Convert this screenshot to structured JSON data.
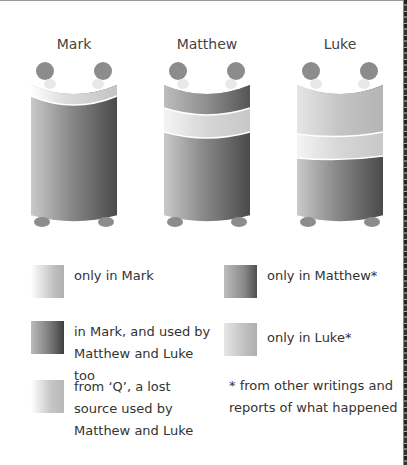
{
  "diagram": {
    "scrolls": [
      {
        "label": "Mark",
        "bands": [
          "only in Mark",
          "in Mark, and used by Matthew and Luke too"
        ]
      },
      {
        "label": "Matthew",
        "bands": [
          "only in Matthew",
          "from Q",
          "in Mark, and used by Matthew and Luke too"
        ]
      },
      {
        "label": "Luke",
        "bands": [
          "only in Luke",
          "from Q",
          "in Mark, and used by Matthew and Luke too"
        ]
      }
    ],
    "colors": {
      "only_mark": "#c8c8c8",
      "shared_mark": "#6a6a6a",
      "from_q": "#d2d2d2",
      "only_matthew": "#7a7a7a",
      "only_luke": "#bdbdbd",
      "roller_knob": "#8c8c8c"
    }
  },
  "legend": {
    "items": [
      {
        "key": "only_mark",
        "text": "only in Mark"
      },
      {
        "key": "only_matthew",
        "text": "only in Matthew*"
      },
      {
        "key": "shared_mark",
        "text": "in Mark, and used by Matthew and Luke too"
      },
      {
        "key": "only_luke",
        "text": "only in Luke*"
      },
      {
        "key": "from_q",
        "text": "from ‘Q’, a lost source used by Matthew and Luke"
      }
    ],
    "footnote": "* from other writings and reports of what happened"
  }
}
